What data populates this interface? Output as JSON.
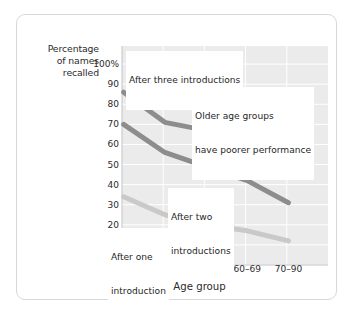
{
  "chart_data": {
    "type": "line",
    "title": "",
    "subtitle": "",
    "xlabel": "Age group",
    "ylabel": "Percentage of names recalled",
    "categories": [
      "18–39",
      "40–49",
      "50–59",
      "60–69",
      "70–90"
    ],
    "ylim": [
      0,
      100
    ],
    "yticks": [
      "0",
      "10",
      "20",
      "30",
      "40",
      "50",
      "60",
      "70",
      "80",
      "90",
      "100%"
    ],
    "ytick_values": [
      0,
      10,
      20,
      30,
      40,
      50,
      60,
      70,
      80,
      90,
      100
    ],
    "grid": true,
    "legend": "none",
    "series": [
      {
        "name": "After three introductions",
        "color": "#8d8d8d",
        "values": [
          86,
          71,
          67,
          58,
          45
        ]
      },
      {
        "name": "After two introductions",
        "color": "#8d8d8d",
        "values": [
          70,
          56,
          49,
          42,
          31
        ]
      },
      {
        "name": "After one introduction",
        "color": "#c9c9c9",
        "values": [
          34,
          25,
          20,
          17,
          12
        ]
      }
    ],
    "annotations": [
      {
        "id": "after-three-introductions",
        "text": "After three introductions",
        "lines": [
          "After three introductions"
        ]
      },
      {
        "id": "older-age-groups",
        "text": "Older age groups have poorer performance",
        "lines": [
          "Older age groups",
          "have poorer performance"
        ]
      },
      {
        "id": "after-two-introductions",
        "text": "After two introductions",
        "lines": [
          "After two",
          "introductions"
        ]
      },
      {
        "id": "after-one-introduction",
        "text": "After one introduction",
        "lines": [
          "After one",
          "introduction"
        ]
      }
    ],
    "colors": {
      "plot_background": "#ebebeb",
      "gridline": "#ffffff",
      "axis_text": "#2b2b2b",
      "series_dark": "#8d8d8d",
      "series_light": "#c9c9c9",
      "card_border": "#d8d8d8"
    }
  },
  "ylabel_lines": [
    "Percentage",
    "of names",
    "recalled"
  ]
}
